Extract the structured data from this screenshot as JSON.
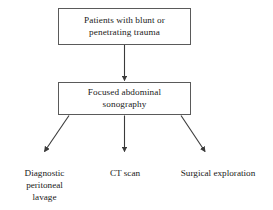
{
  "diagram": {
    "background_color": "#ffffff",
    "line_color": "#3a3a3a",
    "box_border_color": "#5a5a5a",
    "text_color": "#1a1a1a",
    "nodes": {
      "patients": {
        "label": "Patients with blunt or\npenetrating trauma",
        "shape": "rectangle"
      },
      "sonography": {
        "label": "Focused abdominal\nsonography",
        "shape": "rectangle"
      },
      "dpl": {
        "label": "Diagnostic\nperitoneal\nlavage",
        "shape": "plain-text"
      },
      "ct": {
        "label": "CT scan",
        "shape": "plain-text"
      },
      "surgical": {
        "label": "Surgical exploration",
        "shape": "plain-text"
      }
    },
    "edges": [
      {
        "name": "patients-to-sonography",
        "from": "patients",
        "to": "sonography",
        "style": "solid-arrow",
        "direction": "down"
      },
      {
        "name": "sonography-to-dpl",
        "from": "sonography",
        "to": "dpl",
        "style": "solid-arrow",
        "direction": "down-left"
      },
      {
        "name": "sonography-to-ct",
        "from": "sonography",
        "to": "ct",
        "style": "solid-arrow",
        "direction": "down"
      },
      {
        "name": "sonography-to-surgical",
        "from": "sonography",
        "to": "surgical",
        "style": "solid-arrow",
        "direction": "down-right"
      }
    ]
  }
}
